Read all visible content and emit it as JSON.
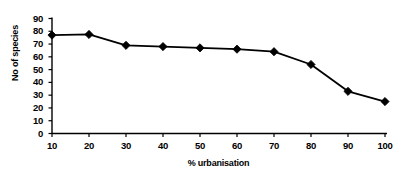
{
  "chart_data": {
    "type": "line",
    "title": "",
    "xlabel": "% urbanisation",
    "ylabel": "No of species",
    "x": [
      10,
      20,
      30,
      40,
      50,
      60,
      70,
      80,
      90,
      100
    ],
    "values": [
      77,
      77.5,
      69,
      68,
      67,
      66,
      64,
      54,
      33,
      25
    ],
    "series": [
      {
        "name": "No of species",
        "values": [
          77,
          77.5,
          69,
          68,
          67,
          66,
          64,
          54,
          33,
          25
        ]
      }
    ],
    "xlim": [
      10,
      100
    ],
    "ylim": [
      0,
      90
    ],
    "xticks": [
      10,
      20,
      30,
      40,
      50,
      60,
      70,
      80,
      90,
      100
    ],
    "yticks": [
      0,
      10,
      20,
      30,
      40,
      50,
      60,
      70,
      80,
      90
    ],
    "xtick_labels": [
      "10",
      "20",
      "30",
      "40",
      "50",
      "60",
      "70",
      "80",
      "90",
      "100"
    ],
    "ytick_labels": [
      "0",
      "10",
      "20",
      "30",
      "40",
      "50",
      "60",
      "70",
      "80",
      "90"
    ],
    "grid": false,
    "legend": false,
    "legend_position": "none",
    "marker": "diamond",
    "marker_color": "#000000",
    "line_color": "#000000",
    "background_color": "#ffffff",
    "annotations": []
  }
}
